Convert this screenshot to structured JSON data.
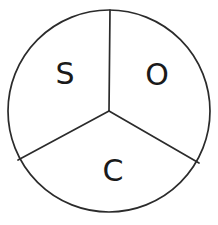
{
  "figure": {
    "kind": "sector-circle-diagram",
    "background_color": "#ffffff",
    "stroke_color": "#2b2b2b",
    "label_color": "#1a1a1a",
    "circle": {
      "center_x": 109,
      "center_y": 111,
      "radius": 101
    },
    "sector_count": 3
  },
  "sectors": [
    {
      "id": "sector-s",
      "label": "S",
      "position": "upper-left",
      "label_x": 65,
      "label_y": 75,
      "start_angle_deg": 90,
      "end_angle_deg": 210
    },
    {
      "id": "sector-o",
      "label": "O",
      "position": "upper-right",
      "label_x": 157,
      "label_y": 76,
      "start_angle_deg": 330,
      "end_angle_deg": 90
    },
    {
      "id": "sector-c",
      "label": "C",
      "position": "bottom",
      "label_x": 113,
      "label_y": 172,
      "start_angle_deg": 210,
      "end_angle_deg": 330
    }
  ],
  "dividers": [
    {
      "id": "divider-top",
      "from_x": 109,
      "from_y": 111,
      "to_x": 110,
      "to_y": 10,
      "angle_deg": 90
    },
    {
      "id": "divider-lower-left",
      "from_x": 109,
      "from_y": 111,
      "to_x": 18,
      "to_y": 160,
      "angle_deg": 210
    },
    {
      "id": "divider-lower-right",
      "from_x": 109,
      "from_y": 111,
      "to_x": 199,
      "to_y": 163,
      "angle_deg": 330
    }
  ]
}
